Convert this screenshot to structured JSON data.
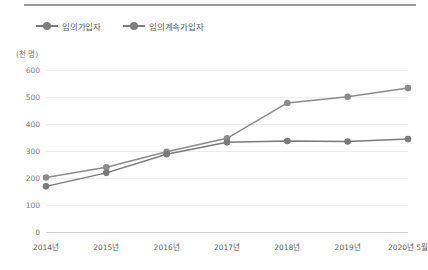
{
  "chart_data": {
    "type": "line",
    "title": "",
    "xlabel": "",
    "ylabel": "",
    "unit_label": "(천 명)",
    "categories": [
      "2014년",
      "2015년",
      "2016년",
      "2017년",
      "2018년",
      "2019년",
      "2020년 5월"
    ],
    "yticks": [
      600,
      500,
      400,
      300,
      200,
      100,
      0
    ],
    "ylim": [
      0,
      600
    ],
    "grid": true,
    "legend_position": "top-left",
    "series": [
      {
        "name": "임의가입자",
        "color": "#8c8c8c",
        "values": [
          202,
          240,
          297,
          347,
          478,
          501,
          533
        ]
      },
      {
        "name": "임의계속가입자",
        "color": "#7a7a7a",
        "values": [
          169,
          219,
          288,
          332,
          337,
          335,
          344
        ]
      }
    ]
  },
  "legend": {
    "items": [
      {
        "label": "임의가입자"
      },
      {
        "label": "임의계속가입자"
      }
    ]
  },
  "axis": {
    "unit": "(천 명)"
  }
}
